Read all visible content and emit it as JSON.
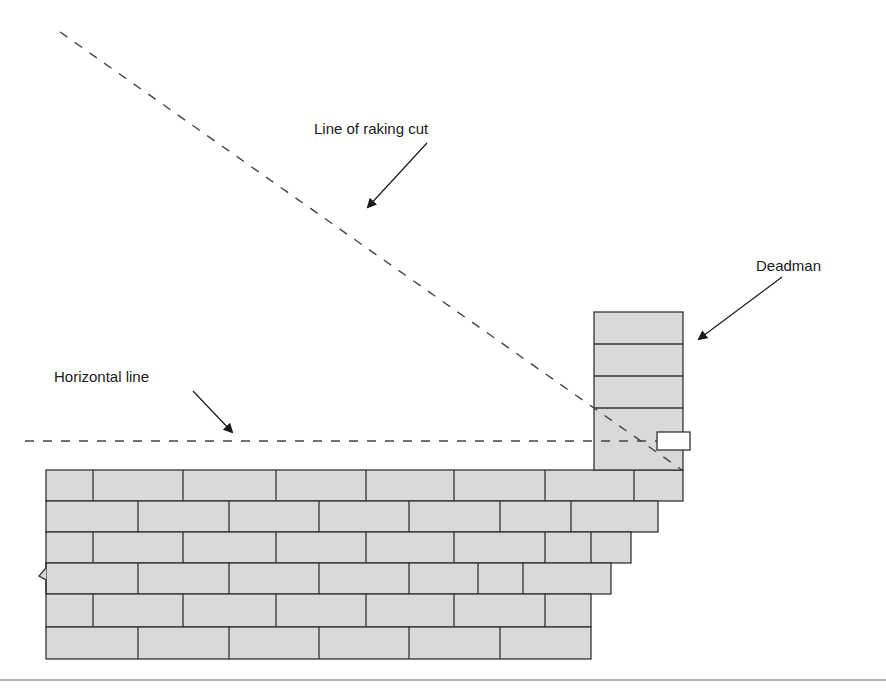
{
  "diagram": {
    "labels": {
      "raking_cut": "Line of raking cut",
      "deadman": "Deadman",
      "horizontal": "Horizontal line"
    },
    "colors": {
      "brick_fill": "#d9d9d9",
      "mortar_line": "#333333",
      "dashed_line": "#444444",
      "arrow": "#1a1a1a",
      "profile_board_fill": "#ffffff",
      "baseline_rule": "#9a9a9a"
    },
    "wall": {
      "left_x": 46,
      "row_boundaries_y": [
        470,
        501,
        532,
        563,
        594,
        627,
        659
      ],
      "courses": [
        {
          "right_x": 683,
          "joints_x": [
            93,
            183,
            276,
            366,
            454,
            545,
            634
          ]
        },
        {
          "right_x": 658,
          "joints_x": [
            138,
            229,
            319,
            409,
            500,
            571
          ]
        },
        {
          "right_x": 631,
          "joints_x": [
            93,
            183,
            276,
            366,
            454,
            545,
            591
          ]
        },
        {
          "right_x": 611,
          "joints_x": [
            138,
            229,
            319,
            409,
            478,
            523
          ]
        },
        {
          "right_x": 591,
          "joints_x": [
            93,
            183,
            276,
            366,
            454,
            545
          ]
        },
        {
          "right_x": 591,
          "joints_x": [
            138,
            229,
            319,
            409,
            500
          ]
        }
      ]
    },
    "deadman_pier": {
      "x": 594,
      "width": 89,
      "top_y": 312,
      "bottom_y": 470,
      "joints_y": [
        344,
        376,
        408
      ]
    },
    "profile_board": {
      "x": 657,
      "y": 432,
      "width": 33,
      "height": 18
    },
    "raking_line": {
      "x1": 60,
      "y1": 32,
      "x2": 682,
      "y2": 470
    },
    "horizontal_line": {
      "x1": 25,
      "y1": 441,
      "x2": 657,
      "y2": 441
    },
    "arrows": [
      {
        "name": "raking-cut-arrow",
        "x1": 427,
        "y1": 143,
        "x2": 368,
        "y2": 207
      },
      {
        "name": "deadman-arrow",
        "x1": 782,
        "y1": 277,
        "x2": 699,
        "y2": 339
      },
      {
        "name": "horizontal-arrow",
        "x1": 193,
        "y1": 391,
        "x2": 232,
        "y2": 432
      }
    ]
  }
}
